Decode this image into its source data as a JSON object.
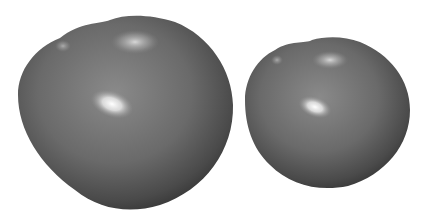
{
  "image": {
    "description": "Two grayscale glossy tomato-like fruits side by side on a white background",
    "background": "#ffffff",
    "fruits": [
      {
        "name": "large-fruit",
        "cx": 125,
        "cy": 118,
        "base_color": "#6e6e6e",
        "dark_color": "#3c3c3c"
      },
      {
        "name": "small-fruit",
        "cx": 327,
        "cy": 128,
        "base_color": "#6e6e6e",
        "dark_color": "#3c3c3c"
      }
    ]
  }
}
